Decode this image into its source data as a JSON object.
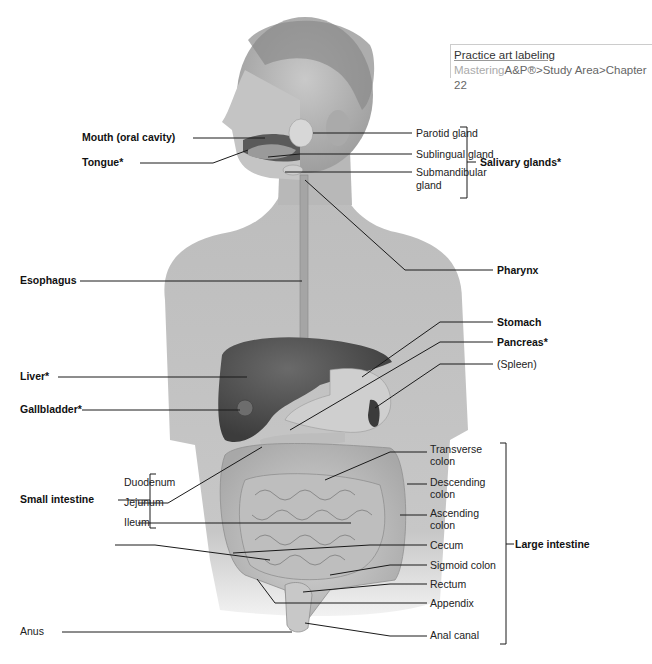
{
  "diagram": {
    "note": {
      "title": "Practice art labeling",
      "path_brand": "Mastering",
      "path_rest": "A&P®>Study Area>Chapter 22"
    },
    "left_labels": {
      "mouth": "Mouth (oral cavity)",
      "tongue": "Tongue*",
      "esophagus": "Esophagus",
      "liver": "Liver*",
      "gallbladder": "Gallbladder*",
      "small_intestine": "Small intestine",
      "duodenum": "Duodenum",
      "jejunum": "Jejunum",
      "ileum": "Ileum",
      "anus": "Anus"
    },
    "right_labels": {
      "parotid": "Parotid gland",
      "sublingual": "Sublingual gland",
      "submandibular_1": "Submandibular",
      "submandibular_2": "gland",
      "salivary": "Salivary glands*",
      "pharynx": "Pharynx",
      "stomach": "Stomach",
      "pancreas": "Pancreas*",
      "spleen": "(Spleen)",
      "transverse_1": "Transverse",
      "transverse_2": "colon",
      "descending_1": "Descending",
      "descending_2": "colon",
      "ascending_1": "Ascending",
      "ascending_2": "colon",
      "cecum": "Cecum",
      "large_intestine": "Large intestine",
      "sigmoid": "Sigmoid colon",
      "rectum": "Rectum",
      "appendix": "Appendix",
      "anal_canal": "Anal canal"
    }
  }
}
